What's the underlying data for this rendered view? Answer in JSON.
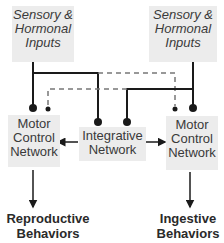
{
  "diagram": {
    "inputs": [
      {
        "id": "left-input",
        "lines": [
          "Sensory &",
          "Hormonal",
          "Inputs"
        ]
      },
      {
        "id": "right-input",
        "lines": [
          "Sensory &",
          "Hormonal",
          "Inputs"
        ]
      }
    ],
    "integrative": {
      "lines": [
        "Integrative",
        "Network"
      ]
    },
    "motor": [
      {
        "id": "left-motor",
        "lines": [
          "Motor",
          "Control",
          "Network"
        ]
      },
      {
        "id": "right-motor",
        "lines": [
          "Motor",
          "Control",
          "Network"
        ]
      }
    ],
    "outputs": [
      {
        "id": "reproductive",
        "lines": [
          "Reproductive",
          "Behaviors"
        ]
      },
      {
        "id": "ingestive",
        "lines": [
          "Ingestive",
          "Behaviors"
        ]
      }
    ],
    "colors": {
      "line": "#1a1a1a",
      "box": "#ececec",
      "dash": "#777777"
    }
  }
}
